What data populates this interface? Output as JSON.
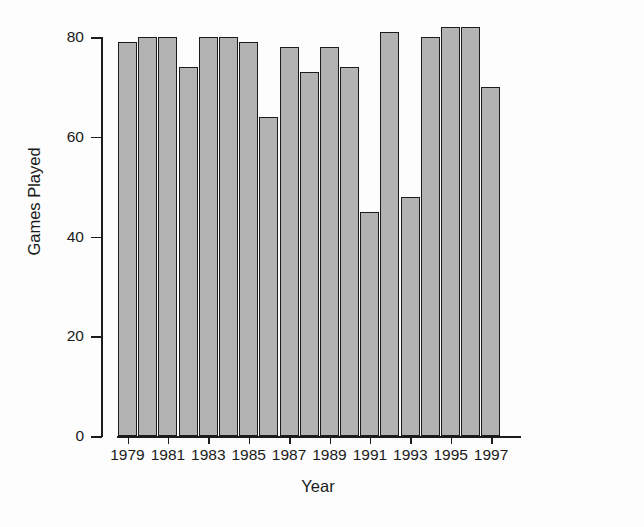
{
  "chart_data": {
    "type": "bar",
    "title": "",
    "subtitle": "",
    "xlabel": "Year",
    "ylabel": "Games Played",
    "categories": [
      "1979",
      "1980",
      "1981",
      "1982",
      "1983",
      "1984",
      "1985",
      "1986",
      "1987",
      "1988",
      "1989",
      "1990",
      "1991",
      "1992",
      "1993",
      "1994",
      "1995",
      "1996",
      "1997"
    ],
    "values": [
      79,
      80,
      80,
      74,
      80,
      80,
      79,
      64,
      78,
      73,
      78,
      74,
      45,
      81,
      48,
      80,
      82,
      82,
      70
    ],
    "series": [
      {
        "name": "Games Played",
        "values": [
          79,
          80,
          80,
          74,
          80,
          80,
          79,
          64,
          78,
          73,
          78,
          74,
          45,
          81,
          48,
          80,
          82,
          82,
          70
        ]
      }
    ],
    "ylim": [
      0,
      84
    ],
    "xlim": [
      1978.5,
      1997.5
    ],
    "y_ticks": [
      0,
      20,
      40,
      60,
      80
    ],
    "y_tick_labels": [
      "0",
      "20",
      "40",
      "60",
      "80"
    ],
    "x_ticks": [
      "1979",
      "1981",
      "1983",
      "1985",
      "1987",
      "1989",
      "1991",
      "1993",
      "1995",
      "1997"
    ],
    "x_tick_labels": [
      "1979",
      "1981",
      "1983",
      "1985",
      "1987",
      "1989",
      "1991",
      "1993",
      "1995",
      "1997"
    ],
    "grid": false,
    "legend": false,
    "legend_position": "none",
    "bar_fill_color": "#b3b3b3",
    "bar_edge_color": "#1c1c1c",
    "axis_color": "#1c1c1c",
    "background_color": "#fdfdfd"
  }
}
